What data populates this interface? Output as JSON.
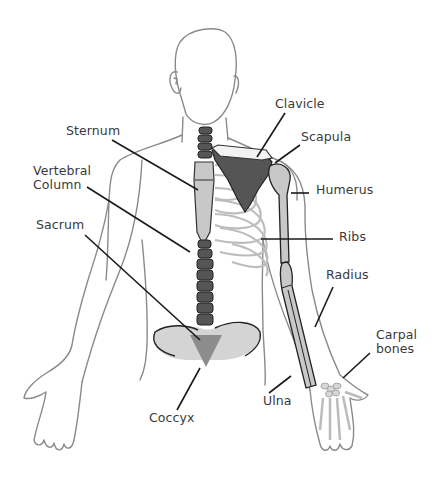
{
  "diagram": {
    "type": "anatomy-skeleton-labeled",
    "colors": {
      "outline": "#8a8a8a",
      "leader_line": "#1a1a1a",
      "dark_bone": "#555555",
      "light_bone": "#c8c8c8",
      "pelvis": "#d4d4d4",
      "coccyx": "#8c8c8c",
      "rib": "#bdbdbd",
      "label_text": "#3a3a3a"
    },
    "labels": {
      "sternum": "Sternum",
      "vertebral_column": "Vertebral\nColumn",
      "sacrum": "Sacrum",
      "coccyx": "Coccyx",
      "clavicle": "Clavicle",
      "scapula": "Scapula",
      "humerus": "Humerus",
      "ribs": "Ribs",
      "radius": "Radius",
      "carpal_bones": "Carpal\nbones",
      "ulna": "Ulna"
    }
  }
}
